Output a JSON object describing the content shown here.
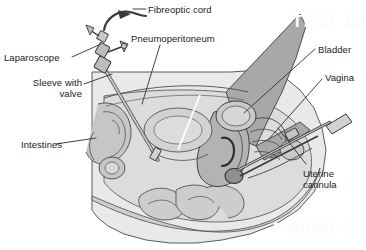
{
  "figure": {
    "type": "medical-illustration",
    "style": "grayscale line drawing",
    "colors": {
      "line": "#3a3a3a",
      "label_text": "#1b1b1b",
      "body_light": "#e9e9e9",
      "body_mid": "#d2d2d2",
      "organ_mid": "#c2c2c2",
      "organ_dark": "#a9a9a9",
      "drape_gray": "#a8a8a8",
      "instrument": "#bdbdbd",
      "background": "#ffffff"
    }
  },
  "labels": [
    {
      "id": "fibreoptic",
      "text": "Fibreoptic cord",
      "align": "left"
    },
    {
      "id": "pneumo",
      "text": "Pneumoperitoneum",
      "align": "left"
    },
    {
      "id": "laparoscope",
      "text": "Laparoscope",
      "align": "left"
    },
    {
      "id": "sleeve",
      "text": "Sleeve with\nvalve",
      "align": "right"
    },
    {
      "id": "intestines",
      "text": "Intestines",
      "align": "left"
    },
    {
      "id": "bladder",
      "text": "Bladder",
      "align": "left"
    },
    {
      "id": "vagina",
      "text": "Vagina",
      "align": "left"
    },
    {
      "id": "uterine",
      "text": "Uterine\ncannula",
      "align": "left"
    }
  ],
  "bleedthrough": {
    "top": "TEST 63",
    "bottom": "FINDINGS"
  }
}
